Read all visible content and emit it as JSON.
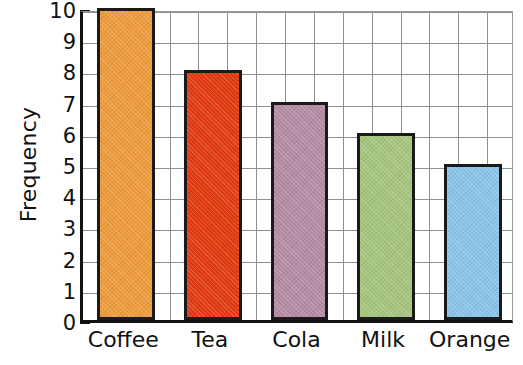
{
  "chart_data": {
    "type": "bar",
    "title": "",
    "xlabel": "",
    "ylabel": "Frequency",
    "categories": [
      "Coffee",
      "Tea",
      "Cola",
      "Milk",
      "Orange"
    ],
    "values": [
      10,
      8,
      7,
      6,
      5
    ],
    "series": [
      {
        "name": "Frequency",
        "values": [
          10,
          8,
          7,
          6,
          5
        ]
      }
    ],
    "ylim": [
      0,
      10
    ],
    "ytick_labels": [
      "0",
      "1",
      "2",
      "3",
      "4",
      "5",
      "6",
      "7",
      "8",
      "9",
      "10"
    ],
    "ytick_values": [
      0,
      1,
      2,
      3,
      4,
      5,
      6,
      7,
      8,
      9,
      10
    ],
    "grid": true,
    "legend": "none",
    "bar_colors": [
      "#EE9B3B",
      "#E23A11",
      "#B58BA6",
      "#A5C57F",
      "#8AC4E8"
    ],
    "bar_outline_color": "#1a1a1a",
    "grid_color": "#8f8f8f",
    "axis_color": "#111111",
    "background_color": "#ffffff",
    "bars": [
      {
        "label": "Coffee",
        "value": 10,
        "color": "#EE9B3B"
      },
      {
        "label": "Tea",
        "value": 8,
        "color": "#E23A11"
      },
      {
        "label": "Cola",
        "value": 7,
        "color": "#B58BA6"
      },
      {
        "label": "Milk",
        "value": 6,
        "color": "#A5C57F"
      },
      {
        "label": "Orange",
        "value": 5,
        "color": "#8AC4E8"
      }
    ]
  }
}
